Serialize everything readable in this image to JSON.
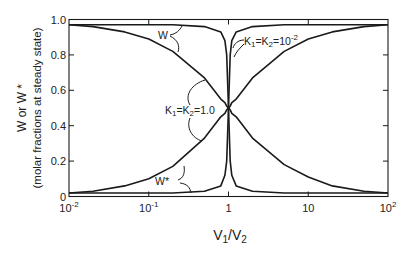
{
  "chart_data": {
    "type": "line",
    "title": "",
    "xlabel": "V1/V2",
    "ylabel": "W or W*",
    "ylabel_sub": "(molar fractions at steady state)",
    "xscale": "log",
    "xlim": [
      0.01,
      100
    ],
    "ylim": [
      0,
      1.0
    ],
    "x_ticks": [
      {
        "value": 0.01,
        "base": "10",
        "exp": "-2"
      },
      {
        "value": 0.1,
        "base": "10",
        "exp": "-1"
      },
      {
        "value": 1,
        "base": "1",
        "exp": ""
      },
      {
        "value": 10,
        "base": "10",
        "exp": ""
      },
      {
        "value": 100,
        "base": "10",
        "exp": "2"
      }
    ],
    "y_ticks": [
      {
        "value": 0,
        "label": "0"
      },
      {
        "value": 0.2,
        "label": "0.2"
      },
      {
        "value": 0.4,
        "label": "0.4"
      },
      {
        "value": 0.6,
        "label": "0.6"
      },
      {
        "value": 0.8,
        "label": "0.8"
      },
      {
        "value": 1.0,
        "label": "1.0"
      }
    ],
    "grid": false,
    "legend": null,
    "x": [
      0.01,
      0.02,
      0.05,
      0.1,
      0.2,
      0.5,
      0.8,
      0.9,
      0.95,
      1.0,
      1.05,
      1.1,
      1.25,
      2,
      5,
      10,
      20,
      50,
      100
    ],
    "series": [
      {
        "name": "W (K1=K2=1.0)",
        "values": [
          0.97,
          0.96,
          0.93,
          0.89,
          0.82,
          0.67,
          0.55,
          0.53,
          0.51,
          0.5,
          0.49,
          0.47,
          0.45,
          0.33,
          0.18,
          0.11,
          0.06,
          0.03,
          0.02
        ]
      },
      {
        "name": "W* (K1=K2=1.0)",
        "values": [
          0.02,
          0.03,
          0.06,
          0.1,
          0.17,
          0.33,
          0.45,
          0.47,
          0.49,
          0.5,
          0.51,
          0.53,
          0.55,
          0.67,
          0.82,
          0.89,
          0.93,
          0.96,
          0.97
        ]
      },
      {
        "name": "W (K1=K2=10^-2)",
        "values": [
          0.97,
          0.97,
          0.97,
          0.97,
          0.97,
          0.96,
          0.93,
          0.88,
          0.8,
          0.5,
          0.2,
          0.12,
          0.06,
          0.03,
          0.02,
          0.02,
          0.02,
          0.02,
          0.02
        ]
      },
      {
        "name": "W* (K1=K2=10^-2)",
        "values": [
          0.02,
          0.02,
          0.02,
          0.02,
          0.02,
          0.03,
          0.06,
          0.12,
          0.2,
          0.5,
          0.8,
          0.88,
          0.93,
          0.96,
          0.97,
          0.97,
          0.97,
          0.97,
          0.97
        ]
      }
    ],
    "annotations": [
      {
        "text": "W",
        "target": "upper curves"
      },
      {
        "text": "W*",
        "target": "lower curves"
      },
      {
        "text_k": "K",
        "sub1": "1",
        "eq": "=K",
        "sub2": "2",
        "val": "=1.0",
        "target": "K1=K2=1.0 curves"
      },
      {
        "text_k": "K",
        "sub1": "1",
        "eq": "=K",
        "sub2": "2",
        "val": "=10",
        "exp": "-2",
        "target": "K1=K2=10^-2 curves"
      }
    ]
  },
  "labels": {
    "ylabel_main": "W or W *",
    "ylabel_sub": "(molar fractions at steady state)",
    "xlabel_v": "V",
    "xlabel_sub1": "1",
    "xlabel_slash": "/V",
    "xlabel_sub2": "2",
    "anno_w": "W",
    "anno_wstar": "W*",
    "k_letter": "K",
    "k_sub1": "1",
    "k_eq": "=K",
    "k_sub2": "2",
    "k_val_one": "=1.0",
    "k_val_ten": "=10",
    "k_exp": "-2"
  }
}
